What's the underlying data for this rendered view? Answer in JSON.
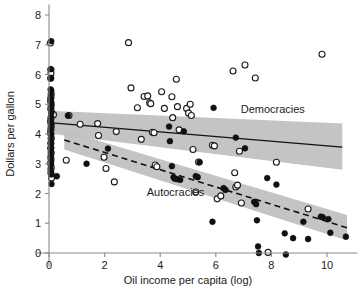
{
  "chart_data": {
    "type": "scatter",
    "title": "",
    "xlabel": "Oil income per capita (log)",
    "ylabel": "Dollars per gallon",
    "xlim": [
      -0.45,
      11.1
    ],
    "ylim": [
      -0.45,
      8.35
    ],
    "xticks": [
      0,
      2,
      4,
      6,
      8,
      10
    ],
    "xticklabels": [
      "0",
      "2",
      "4",
      "6",
      "8",
      "10"
    ],
    "yticks": [
      0,
      1,
      2,
      3,
      4,
      5,
      6,
      7,
      8
    ],
    "yticklabels": [
      "0",
      "1",
      "2",
      "3",
      "4",
      "5",
      "6",
      "7",
      "8"
    ],
    "grid": false,
    "legend_position": "inline-annotation",
    "annotations": [
      {
        "text": "Democracies",
        "x": 8.05,
        "y": 4.72
      },
      {
        "text": "Autocracies",
        "x": 4.55,
        "y": 1.92
      }
    ],
    "series": [
      {
        "name": "Democracies",
        "marker": "open-circle",
        "marker_color": "#ffffff",
        "edge_color": "#1a1a1a",
        "points": [
          [
            0.05,
            7.06
          ],
          [
            0.07,
            6.16
          ],
          [
            0.07,
            6.03
          ],
          [
            0.06,
            5.87
          ],
          [
            0.08,
            5.35
          ],
          [
            0.07,
            5.22
          ],
          [
            0.06,
            5.1
          ],
          [
            0.08,
            4.98
          ],
          [
            0.07,
            4.86
          ],
          [
            0.09,
            4.74
          ],
          [
            0.16,
            4.65
          ],
          [
            0.07,
            4.52
          ],
          [
            0.06,
            4.4
          ],
          [
            0.08,
            4.28
          ],
          [
            0.07,
            4.16
          ],
          [
            0.06,
            4.02
          ],
          [
            0.08,
            3.86
          ],
          [
            0.07,
            3.7
          ],
          [
            0.06,
            3.52
          ],
          [
            0.08,
            3.36
          ],
          [
            0.07,
            3.18
          ],
          [
            0.06,
            3.02
          ],
          [
            0.08,
            2.86
          ],
          [
            0.07,
            2.7
          ],
          [
            0.09,
            2.52
          ],
          [
            0.62,
            3.12
          ],
          [
            0.72,
            4.62
          ],
          [
            1.12,
            4.33
          ],
          [
            1.75,
            4.35
          ],
          [
            1.78,
            3.95
          ],
          [
            1.98,
            3.22
          ],
          [
            2.05,
            2.84
          ],
          [
            2.35,
            2.39
          ],
          [
            2.42,
            4.08
          ],
          [
            2.86,
            7.07
          ],
          [
            2.95,
            5.55
          ],
          [
            3.18,
            4.88
          ],
          [
            3.32,
            3.82
          ],
          [
            3.42,
            5.26
          ],
          [
            3.55,
            5.28
          ],
          [
            3.62,
            5.05
          ],
          [
            3.66,
            5.02
          ],
          [
            3.72,
            4.06
          ],
          [
            3.78,
            4.04
          ],
          [
            3.82,
            2.96
          ],
          [
            3.88,
            2.9
          ],
          [
            4.05,
            5.42
          ],
          [
            4.15,
            4.86
          ],
          [
            4.42,
            5.25
          ],
          [
            4.45,
            4.55
          ],
          [
            4.58,
            5.84
          ],
          [
            4.62,
            4.92
          ],
          [
            4.68,
            4.14
          ],
          [
            4.95,
            4.86
          ],
          [
            5.02,
            4.7
          ],
          [
            5.08,
            5.0
          ],
          [
            5.12,
            4.62
          ],
          [
            5.18,
            3.48
          ],
          [
            5.28,
            2.05
          ],
          [
            5.38,
            3.06
          ],
          [
            5.88,
            3.62
          ],
          [
            5.95,
            3.6
          ],
          [
            6.05,
            1.82
          ],
          [
            6.18,
            1.92
          ],
          [
            6.62,
            6.12
          ],
          [
            6.68,
            2.7
          ],
          [
            6.72,
            2.22
          ],
          [
            6.78,
            2.28
          ],
          [
            6.85,
            3.42
          ],
          [
            6.92,
            1.68
          ],
          [
            7.05,
            6.32
          ],
          [
            7.42,
            5.88
          ],
          [
            7.88,
            0.02
          ],
          [
            8.18,
            3.05
          ],
          [
            9.32,
            1.48
          ],
          [
            9.82,
            6.68
          ]
        ]
      },
      {
        "name": "Autocracies",
        "marker": "filled-circle",
        "marker_color": "#101010",
        "edge_color": "#101010",
        "points": [
          [
            0.08,
            7.12
          ],
          [
            0.06,
            6.18
          ],
          [
            0.07,
            5.88
          ],
          [
            0.06,
            5.5
          ],
          [
            0.08,
            5.46
          ],
          [
            0.07,
            5.3
          ],
          [
            0.06,
            5.18
          ],
          [
            0.08,
            5.06
          ],
          [
            0.07,
            4.94
          ],
          [
            0.06,
            4.82
          ],
          [
            0.08,
            4.7
          ],
          [
            0.07,
            4.58
          ],
          [
            0.06,
            4.46
          ],
          [
            0.08,
            4.34
          ],
          [
            0.07,
            4.22
          ],
          [
            0.06,
            4.1
          ],
          [
            0.08,
            3.98
          ],
          [
            0.07,
            3.84
          ],
          [
            0.06,
            3.68
          ],
          [
            0.08,
            3.54
          ],
          [
            0.07,
            3.4
          ],
          [
            0.06,
            3.26
          ],
          [
            0.08,
            3.1
          ],
          [
            0.07,
            2.96
          ],
          [
            0.06,
            2.8
          ],
          [
            0.08,
            2.64
          ],
          [
            0.09,
            2.32
          ],
          [
            0.28,
            2.58
          ],
          [
            0.68,
            4.62
          ],
          [
            1.35,
            3.0
          ],
          [
            2.12,
            3.51
          ],
          [
            4.32,
            4.25
          ],
          [
            4.35,
            3.76
          ],
          [
            4.42,
            2.92
          ],
          [
            4.48,
            2.55
          ],
          [
            4.52,
            2.5
          ],
          [
            4.62,
            2.48
          ],
          [
            4.72,
            2.46
          ],
          [
            4.85,
            4.09
          ],
          [
            5.28,
            2.58
          ],
          [
            5.35,
            2.55
          ],
          [
            5.42,
            3.05
          ],
          [
            5.88,
            1.05
          ],
          [
            5.92,
            4.88
          ],
          [
            6.28,
            2.18
          ],
          [
            6.35,
            2.12
          ],
          [
            6.72,
            3.88
          ],
          [
            7.05,
            3.52
          ],
          [
            7.38,
            1.72
          ],
          [
            7.42,
            1.7
          ],
          [
            7.45,
            1.64
          ],
          [
            7.48,
            1.1
          ],
          [
            7.52,
            0.22
          ],
          [
            7.55,
            0.0
          ],
          [
            7.85,
            2.52
          ],
          [
            8.18,
            2.3
          ],
          [
            8.48,
            0.66
          ],
          [
            8.52,
            -0.05
          ],
          [
            8.78,
            0.5
          ],
          [
            9.15,
            1.05
          ],
          [
            9.32,
            0.47
          ],
          [
            9.78,
            1.22
          ],
          [
            9.85,
            1.2
          ],
          [
            10.05,
            1.14
          ],
          [
            10.12,
            0.68
          ],
          [
            10.68,
            0.55
          ]
        ]
      }
    ],
    "fits": [
      {
        "name": "Democracies",
        "style": "solid",
        "x_start": 0.0,
        "x_end": 10.55,
        "y_start": 4.38,
        "y_end": 3.56,
        "ci_x_start": 0.0,
        "ci_x_end": 10.55,
        "ci_upper_start": 4.78,
        "ci_upper_end": 4.35,
        "ci_lower_start": 4.02,
        "ci_lower_end": 2.8
      },
      {
        "name": "Autocracies",
        "style": "dashed",
        "x_start": 0.55,
        "x_end": 10.72,
        "y_start": 3.8,
        "y_end": 0.85,
        "ci_x_start": 0.55,
        "ci_x_end": 10.72,
        "ci_upper_start": 4.12,
        "ci_upper_end": 1.28,
        "ci_lower_start": 3.48,
        "ci_lower_end": 0.42
      }
    ]
  }
}
